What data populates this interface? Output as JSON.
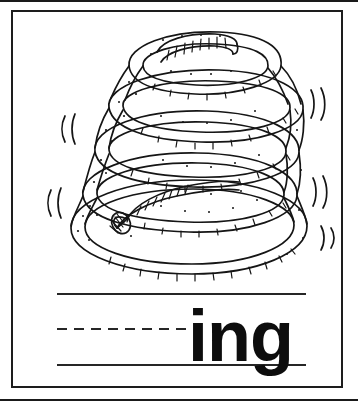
{
  "card": {
    "type": "phonics-flashcard",
    "word_ending": "ing",
    "picture_subject": "spring",
    "background_color": "#ffffff",
    "ink_color": "#1a1a1a"
  },
  "illustration": {
    "name": "coiled-spring-drawing",
    "description": "black and white line drawing of a bouncing coiled spring with motion marks",
    "coil_count": 5,
    "motion_marks": [
      {
        "side": "left",
        "position": "upper",
        "glyph": "(("
      },
      {
        "side": "left",
        "position": "lower",
        "glyph": "(("
      },
      {
        "side": "right",
        "position": "upper",
        "glyph": "))"
      },
      {
        "side": "right",
        "position": "middle",
        "glyph": "))"
      },
      {
        "side": "right",
        "position": "lower",
        "glyph": ")"
      }
    ]
  },
  "practice_lines": {
    "top_line_style": "solid",
    "middle_line_style": "dashed",
    "bottom_line_style": "solid",
    "writing_space_label": ""
  },
  "text": {
    "ending": "ing"
  }
}
